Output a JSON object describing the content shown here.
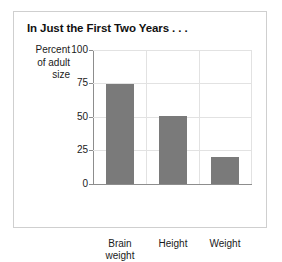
{
  "chart_data": {
    "type": "bar",
    "title": "In Just the First Two Years . . .",
    "xlabel": "",
    "ylabel": "Percent of adult size",
    "ylabel_lines": [
      "Percent",
      "of adult",
      "size"
    ],
    "categories": [
      "Brain weight",
      "Height",
      "Weight"
    ],
    "category_lines": [
      [
        "Brain",
        "weight"
      ],
      [
        "Height"
      ],
      [
        "Weight"
      ]
    ],
    "values": [
      75,
      51,
      20
    ],
    "ylim": [
      0,
      100
    ],
    "yticks": [
      0,
      25,
      50,
      75,
      100
    ],
    "ytick_labels": [
      "0",
      "25",
      "50",
      "75",
      "100"
    ],
    "grid": true,
    "legend": "none",
    "bar_color": "#7a7a7a",
    "grid_color": "#e2e2e2",
    "axis_color": "#8d8d8d",
    "border_color": "#cfcfcf",
    "background": "#ffffff"
  }
}
